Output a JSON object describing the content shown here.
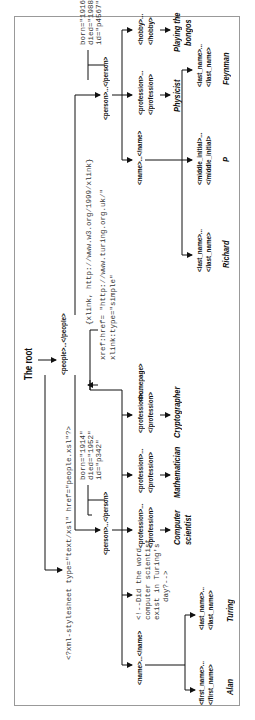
{
  "diagram": {
    "root_label": "The root",
    "people": "<people>...</people>",
    "stylesheet_pi": "<?xml-stylesheet type=\"text/xsl\" href=\"people.xsl\"?>",
    "persons": [
      {
        "tag": "<person>...</person>",
        "attributes": [
          "born=\"1914\"",
          "died=\"1952\"",
          "id=\"p342\""
        ],
        "name": {
          "tag": "<name>...</name>",
          "children": [
            {
              "open": "<first_name>...",
              "close": "</first_name>",
              "value": "Alan"
            },
            {
              "open": "<last_name>...",
              "close": "</last_name>",
              "value": "Turing"
            }
          ]
        },
        "comment": [
          "<!--Did the word",
          "computer scientist",
          "exist in Turing's",
          "day?-->"
        ],
        "professions": [
          {
            "open": "<profession>...",
            "close": "</profession>",
            "value": [
              "Computer",
              "scientist"
            ]
          },
          {
            "open": "<profession>...",
            "close": "</profession>",
            "value": [
              "Mathematician"
            ]
          },
          {
            "open": "<profession>...",
            "close": "</profession>",
            "value": [
              "Cryptographer"
            ]
          }
        ],
        "homepage": {
          "tag": "<homepage>",
          "attributes": [
            "{xlink, http://www.w3.org/1999/xlink}",
            "xref:href= \"http://www.turing.org.uk/\"",
            "xlink:type=\"simple\""
          ]
        }
      },
      {
        "tag": "<person>...</person>",
        "attributes": [
          "born=\"1916\"",
          "died=\"1988\"",
          "id=\"p4567\""
        ],
        "name": {
          "tag": "<name>...</name>",
          "children": [
            {
              "open": "<last_name>...",
              "close": "</last_name>",
              "value": "Richard"
            },
            {
              "open": "<middle_initial>...",
              "close": "</middle_initial>",
              "value": "P"
            },
            {
              "open": "<last_name>...",
              "close": "</last_name>",
              "value": "Feynman"
            }
          ]
        },
        "professions": [
          {
            "open": "<profession>...",
            "close": "</profession>",
            "value": [
              "Physicist"
            ]
          }
        ],
        "hobby": {
          "open": "<hobby>...",
          "close": "</hobby>",
          "value": [
            "Playing the",
            "bongos"
          ]
        }
      }
    ]
  }
}
